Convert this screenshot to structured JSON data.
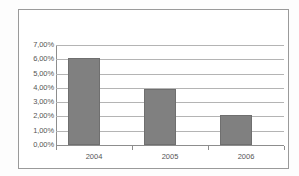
{
  "chart_data": {
    "type": "bar",
    "title": "",
    "subtitle": "",
    "xlabel": "",
    "ylabel": "",
    "categories": [
      "2004",
      "2005",
      "2006"
    ],
    "values": [
      6.1,
      3.9,
      2.1
    ],
    "value_labels": [
      "6,10%",
      "3,90%",
      "2,10%"
    ],
    "series": [
      {
        "name": "",
        "values": [
          6.1,
          3.9,
          2.1
        ]
      }
    ],
    "ylim": [
      0,
      7
    ],
    "ytick_values": [
      7,
      6,
      5,
      4,
      3,
      2,
      1,
      0
    ],
    "ytick_labels": [
      "7,00%",
      "6,00%",
      "5,00%",
      "4,00%",
      "3,00%",
      "2,00%",
      "1,00%",
      "0,00%"
    ],
    "xtick_labels": [
      "2004",
      "2005",
      "2006"
    ],
    "grid": true,
    "grid_axis": "y",
    "legend": false,
    "legend_position": "none",
    "annotations": [],
    "colors": {
      "bar_fill": "#808080",
      "bar_border": "#6f6f6f",
      "gridline": "#b4b4b4",
      "axis": "#8d8d8d",
      "frame": "#9a9a9a",
      "tick_label": "#555555",
      "plot_background": "#ffffff"
    }
  }
}
